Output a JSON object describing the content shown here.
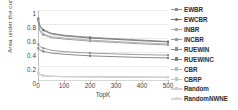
{
  "chart_data": {
    "type": "line",
    "title": "",
    "xlabel": "TopK",
    "ylabel": "Area under the curve",
    "xlim": [
      0,
      500
    ],
    "ylim": [
      0,
      1
    ],
    "xticks": [
      0,
      100,
      200,
      300,
      400,
      500
    ],
    "xticklabels": [
      "0",
      "100",
      "200",
      "300",
      "400",
      "500"
    ],
    "yticks": [
      0,
      0.2,
      0.4,
      0.6,
      0.8,
      1
    ],
    "yticklabels": [
      "0",
      "0.2",
      "0.4",
      "0.6",
      "0.8",
      "1"
    ],
    "grid": "horizontal",
    "legend_position": "right",
    "x": [
      1,
      5,
      10,
      20,
      50,
      100,
      200,
      300,
      400,
      500
    ],
    "series": [
      {
        "name": "EWBR",
        "color": "#8c8c8c",
        "marker": "dash",
        "values": [
          0.88,
          0.8,
          0.76,
          0.72,
          0.67,
          0.64,
          0.61,
          0.59,
          0.57,
          0.55
        ]
      },
      {
        "name": "EWCBR",
        "color": "#6e6e6e",
        "marker": "circle",
        "values": [
          0.87,
          0.79,
          0.75,
          0.71,
          0.66,
          0.63,
          0.6,
          0.58,
          0.56,
          0.545
        ]
      },
      {
        "name": "INBR",
        "color": "#a8a8a8",
        "marker": "dash",
        "values": [
          0.85,
          0.74,
          0.7,
          0.66,
          0.62,
          0.6,
          0.57,
          0.55,
          0.53,
          0.515
        ]
      },
      {
        "name": "INCBR",
        "color": "#999999",
        "marker": "dash",
        "values": [
          0.84,
          0.72,
          0.68,
          0.645,
          0.605,
          0.585,
          0.555,
          0.535,
          0.515,
          0.5
        ]
      },
      {
        "name": "RUEWIN",
        "color": "#8f8f8f",
        "marker": "dash",
        "values": [
          0.51,
          0.49,
          0.475,
          0.455,
          0.425,
          0.405,
          0.385,
          0.372,
          0.362,
          0.355
        ]
      },
      {
        "name": "RUEWINC",
        "color": "#7d7d7d",
        "marker": "dash",
        "values": [
          0.455,
          0.435,
          0.425,
          0.41,
          0.385,
          0.368,
          0.345,
          0.333,
          0.322,
          0.315
        ]
      },
      {
        "name": "CBR",
        "color": "#bcbcbc",
        "marker": "dash",
        "values": [
          0.1,
          0.085,
          0.075,
          0.065,
          0.055,
          0.05,
          0.046,
          0.044,
          0.042,
          0.04
        ]
      },
      {
        "name": "CBRP",
        "color": "#c6c6c6",
        "marker": "dash",
        "values": [
          0.098,
          0.082,
          0.072,
          0.062,
          0.053,
          0.048,
          0.045,
          0.043,
          0.041,
          0.039
        ]
      },
      {
        "name": "Random",
        "color": "#d0d0d0",
        "marker": "dash",
        "values": [
          0.095,
          0.08,
          0.07,
          0.06,
          0.051,
          0.047,
          0.044,
          0.042,
          0.04,
          0.038
        ]
      },
      {
        "name": "RandomNWNE",
        "color": "#d6d6d6",
        "marker": "dash",
        "values": [
          0.092,
          0.078,
          0.068,
          0.058,
          0.05,
          0.046,
          0.043,
          0.041,
          0.039,
          0.037
        ]
      }
    ]
  }
}
